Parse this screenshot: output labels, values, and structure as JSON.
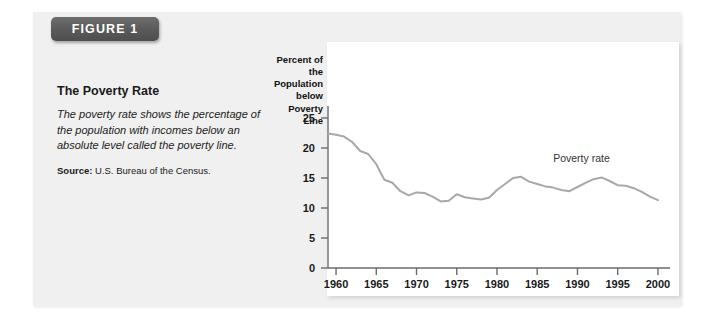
{
  "figure": {
    "badge_label": "FIGURE 1",
    "title": "The Poverty Rate",
    "description": "The poverty rate shows the percentage of the population with incomes below an absolute level called the poverty line.",
    "source_label": "Source:",
    "source_text": " U.S. Bureau of the Census."
  },
  "colors": {
    "badge_background": "#5c5c5c",
    "badge_text": "#ffffff",
    "card_background": "#f0f0f0",
    "panel_background": "#ffffff",
    "axis": "#6b6b6b",
    "series_line": "#a8a8a8",
    "text": "#1a1a1a"
  },
  "chart_data": {
    "type": "line",
    "title": "",
    "xlabel": "",
    "ylabel": "Percent of the Population below Poverty Line",
    "ylabel_lines": [
      "Percent of the",
      "Population",
      "below Poverty",
      "Line"
    ],
    "xlim": [
      1959,
      2001
    ],
    "ylim": [
      0,
      27
    ],
    "yticks": [
      0,
      5,
      10,
      15,
      20,
      25
    ],
    "ytick_labels": [
      "0",
      "5",
      "10",
      "15",
      "20",
      "25"
    ],
    "xticks": [
      1960,
      1965,
      1970,
      1975,
      1980,
      1985,
      1990,
      1995,
      2000
    ],
    "xtick_labels": [
      "1960",
      "1965",
      "1970",
      "1975",
      "1980",
      "1985",
      "1990",
      "1995",
      "2000"
    ],
    "grid": false,
    "legend_position": "inline-annotation",
    "annotations": [
      {
        "text": "Poverty rate",
        "x": 1990.5,
        "y": 17.6
      }
    ],
    "series": [
      {
        "name": "Poverty rate",
        "color": "#a8a8a8",
        "x": [
          1959,
          1960,
          1961,
          1962,
          1963,
          1964,
          1965,
          1966,
          1967,
          1968,
          1969,
          1970,
          1971,
          1972,
          1973,
          1974,
          1975,
          1976,
          1977,
          1978,
          1979,
          1980,
          1981,
          1982,
          1983,
          1984,
          1985,
          1986,
          1987,
          1988,
          1989,
          1990,
          1991,
          1992,
          1993,
          1994,
          1995,
          1996,
          1997,
          1998,
          1999,
          2000
        ],
        "values": [
          22.4,
          22.2,
          21.9,
          21.0,
          19.5,
          19.0,
          17.3,
          14.7,
          14.2,
          12.8,
          12.1,
          12.6,
          12.5,
          11.9,
          11.1,
          11.2,
          12.3,
          11.8,
          11.6,
          11.4,
          11.7,
          13.0,
          14.0,
          15.0,
          15.2,
          14.4,
          14.0,
          13.6,
          13.4,
          13.0,
          12.8,
          13.5,
          14.2,
          14.8,
          15.1,
          14.5,
          13.8,
          13.7,
          13.3,
          12.7,
          11.9,
          11.3
        ]
      }
    ]
  }
}
